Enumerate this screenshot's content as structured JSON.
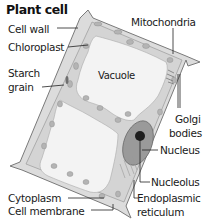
{
  "title": "Plant cell",
  "labels": {
    "cell_wall": "Cell wall",
    "chloroplast": "Chloroplast",
    "starch_grain_1": "Starch",
    "starch_grain_2": "grain",
    "vacuole": "Vacuole",
    "mitochondria": "Mitochondria",
    "golgi_1": "Golgi",
    "golgi_2": "bodies",
    "nucleus": "Nucleus",
    "nucleolus": "Nucleolus",
    "er_1": "Endoplasmic",
    "er_2": "reticulum",
    "cytoplasm": "Cytoplasm",
    "cell_membrane": "Cell membrane"
  },
  "colors": {
    "wall": "#8a8a8a",
    "cytoplasm": "#d9d9d9",
    "vacuole": "#f2f2f2",
    "organelle": "#b0b0b0",
    "nucleus": "#8e8e8e",
    "nucleolus": "#1e1e1e",
    "leader": "#222222"
  }
}
